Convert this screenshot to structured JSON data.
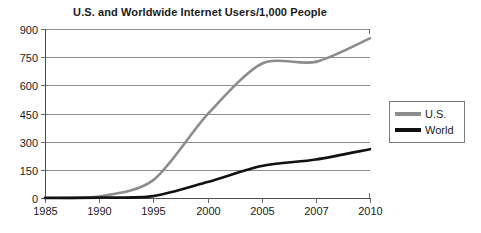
{
  "chart_data": {
    "type": "line",
    "title": "U.S. and Worldwide Internet Users/1,000 People",
    "xlabel": "",
    "ylabel": "",
    "categories": [
      "1985",
      "1990",
      "1995",
      "2000",
      "2005",
      "2007",
      "2010"
    ],
    "ylim": [
      0,
      900
    ],
    "yticks": [
      0,
      150,
      300,
      450,
      600,
      750,
      900
    ],
    "ytick_labels": [
      "0",
      "150",
      "300",
      "450",
      "600",
      "750",
      "900"
    ],
    "grid": true,
    "legend_position": "right",
    "series": [
      {
        "name": "U.S.",
        "color": "#8c8c8c",
        "values": [
          2,
          8,
          95,
          445,
          715,
          725,
          850
        ]
      },
      {
        "name": "World",
        "color": "#111111",
        "values": [
          0,
          2,
          10,
          85,
          170,
          205,
          260
        ]
      }
    ],
    "legend": [
      {
        "label": "U.S.",
        "color": "#8c8c8c"
      },
      {
        "label": "World",
        "color": "#111111"
      }
    ]
  }
}
